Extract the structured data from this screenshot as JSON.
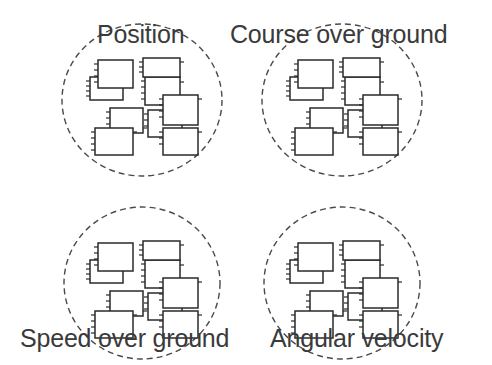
{
  "diagram": {
    "type": "grouped-block-clusters",
    "groups": [
      {
        "id": "position",
        "label": "Position",
        "label_position": "top",
        "cx": 142,
        "cy": 100
      },
      {
        "id": "course-over-ground",
        "label": "Course over ground",
        "label_position": "top",
        "cx": 342,
        "cy": 100
      },
      {
        "id": "speed-over-ground",
        "label": "Speed over ground",
        "label_position": "bottom",
        "cx": 142,
        "cy": 283
      },
      {
        "id": "angular-velocity",
        "label": "Angular velocity",
        "label_position": "bottom",
        "cx": 342,
        "cy": 283
      }
    ],
    "blocks_per_group": 9,
    "colors": {
      "stroke": "#2a2a2a",
      "dashed_circle": "#4a4a4a",
      "text": "#3a3a3a",
      "background": "#ffffff"
    }
  }
}
